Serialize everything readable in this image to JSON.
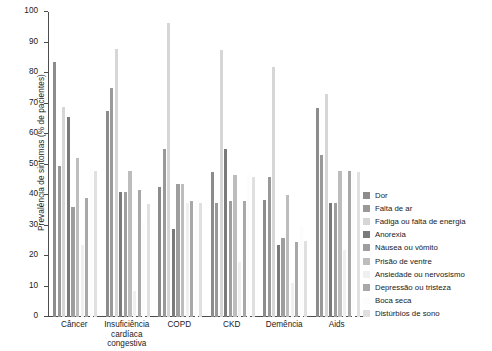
{
  "chart_data": {
    "type": "bar",
    "title": "",
    "subtitle": "",
    "xlabel": "",
    "ylabel": "Prevalência de sintomas (% de pacientes)",
    "ylim": [
      0,
      100
    ],
    "yticks": [
      0,
      10,
      20,
      30,
      40,
      50,
      60,
      70,
      80,
      90,
      100
    ],
    "grid": false,
    "legend_position": "right",
    "categories": [
      "Câncer",
      "Insuficiência cardíaca congestiva",
      "COPD",
      "CKD",
      "Demência",
      "Aids"
    ],
    "category_labels_wrapped": [
      [
        "Câncer"
      ],
      [
        "Insuficiência",
        "cardíaca",
        "congestiva"
      ],
      [
        "COPD"
      ],
      [
        "CKD"
      ],
      [
        "Demência"
      ],
      [
        "Aids"
      ]
    ],
    "series": [
      {
        "name": "Dor",
        "color": "#8c8c8c",
        "values": [
          83.5,
          67.5,
          42.5,
          47.5,
          38.5,
          68.5
        ]
      },
      {
        "name": "Falta de ar",
        "color": "#999999",
        "values": [
          49.5,
          75.0,
          55.0,
          37.5,
          46.0,
          53.0
        ]
      },
      {
        "name": "Fadiga ou falta de energia",
        "color": "#d6d6d6",
        "values": [
          69.0,
          88.0,
          96.5,
          87.5,
          82.0,
          73.0
        ]
      },
      {
        "name": "Anorexia",
        "color": "#7a7a7a",
        "values": [
          65.5,
          41.0,
          29.0,
          55.0,
          23.5,
          37.5
        ]
      },
      {
        "name": "Náusea ou vômito",
        "color": "#9e9e9e",
        "values": [
          36.0,
          41.0,
          43.5,
          38.0,
          26.0,
          37.5
        ]
      },
      {
        "name": "Prisão de ventre",
        "color": "#bdbdbd",
        "values": [
          52.0,
          48.0,
          43.5,
          46.5,
          40.0,
          48.0
        ]
      },
      {
        "name": "Ansiedade ou nervosismo",
        "color": "#f0f0f0",
        "values": [
          23.5,
          8.5,
          37.5,
          18.0,
          11.0,
          22.0
        ]
      },
      {
        "name": "Depressão ou tristeza",
        "color": "#a8a8a8",
        "values": [
          39.0,
          41.5,
          38.0,
          38.0,
          24.5,
          48.0
        ]
      },
      {
        "name": "Boca seca",
        "color": "#fcfcfc",
        "values": [
          49.0,
          31.0,
          38.0,
          47.0,
          30.0,
          48.0
        ]
      },
      {
        "name": "Distúrbios de sono",
        "color": "#e0e0e0",
        "values": [
          48.0,
          37.0,
          37.5,
          46.0,
          25.0,
          47.5
        ]
      }
    ]
  },
  "axis": {
    "y_title": "Prevalência de sintomas (% de pacientes)"
  },
  "legend": {
    "items": [
      {
        "label": "Dor"
      },
      {
        "label": "Falta de ar"
      },
      {
        "label": "Fadiga ou falta de energia"
      },
      {
        "label": "Anorexia"
      },
      {
        "label": "Náusea ou vômito"
      },
      {
        "label": "Prisão de ventre"
      },
      {
        "label": "Ansiedade ou nervosismo"
      },
      {
        "label": "Depressão ou tristeza"
      },
      {
        "label": "Boca seca"
      },
      {
        "label": "Distúrbios de sono"
      }
    ]
  }
}
